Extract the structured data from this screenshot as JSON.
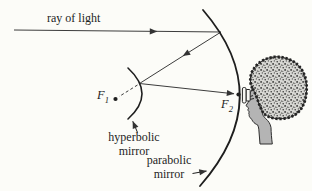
{
  "figure": {
    "type": "optics-reflecting-telescope-diagram",
    "labels": {
      "ray_of_light": "ray of light",
      "f1": {
        "base": "F",
        "sub": "1"
      },
      "f2": {
        "base": "F",
        "sub": "2"
      },
      "hyperbolic_mirror": {
        "line1": "hyperbolic",
        "line2": "mirror"
      },
      "parabolic_mirror": {
        "line1": "parabolic",
        "line2": "mirror"
      }
    },
    "icons": {
      "arrowheads": "direction-arrow-icon",
      "observer": "person-head-profile",
      "eyepiece": "eyepiece-lens"
    },
    "colors": {
      "background": "#fcfcf8",
      "ink": "#1e1e1e",
      "ray": "#3c3c3c",
      "face_gray": "#b4b4b4",
      "hair_gray": "#d7d7d3"
    }
  }
}
